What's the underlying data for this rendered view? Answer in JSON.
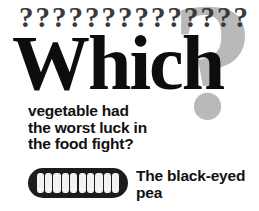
{
  "poster": {
    "width": 259,
    "height": 211,
    "background_color": "#ffffff"
  },
  "decorations": {
    "big_question_mark": {
      "glyph": "?",
      "color": "#b9b9b9"
    },
    "question_mark_row": {
      "glyph": "?",
      "count": 14,
      "color": "#3a3a3a"
    }
  },
  "headline": {
    "text": "Which",
    "color": "#0d0d0d"
  },
  "question_body": {
    "lines": [
      "vegetable had",
      "the worst luck in",
      "the food fight?"
    ],
    "color": "#111111"
  },
  "illustration": {
    "name": "pea-pod",
    "pod_color": "#1c1c1c",
    "pea_color": "#f2f2f2",
    "pea_count": 10
  },
  "answer": {
    "lines": [
      "The black-eyed",
      "pea"
    ],
    "full_text": "The black-eyed pea",
    "color": "#111111"
  }
}
